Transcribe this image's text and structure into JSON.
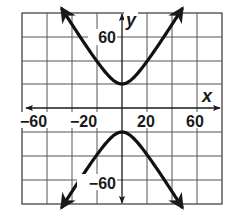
{
  "chart_data": {
    "type": "line",
    "title": "",
    "xlabel": "x",
    "ylabel": "y",
    "xlim": [
      -80,
      80
    ],
    "ylim": [
      -80,
      80
    ],
    "grid": true,
    "grid_step": 20,
    "x_tick_labels": [
      {
        "value": -60,
        "text": "−60"
      },
      {
        "value": -20,
        "text": "−20"
      },
      {
        "value": 20,
        "text": "20"
      },
      {
        "value": 60,
        "text": "60"
      }
    ],
    "y_tick_labels": [
      {
        "value": 60,
        "text": "60"
      },
      {
        "value": -60,
        "text": "−60"
      }
    ],
    "equation": "y^2/400 - x^2/144 = 1",
    "curve_kind": "hyperbola (vertical transverse axis)",
    "vertices": [
      [
        0,
        20
      ],
      [
        0,
        -20
      ]
    ],
    "series": [
      {
        "name": "upper branch",
        "x": [
          -48,
          -40,
          -30,
          -20,
          -10,
          0,
          10,
          20,
          30,
          40,
          48
        ],
        "y": [
          52,
          69.4,
          53.9,
          38.9,
          26.0,
          20,
          26.0,
          38.9,
          53.9,
          69.4,
          82.5
        ]
      },
      {
        "name": "lower branch",
        "x": [
          -48,
          -40,
          -30,
          -20,
          -10,
          0,
          10,
          20,
          30,
          40,
          48
        ],
        "y": [
          -82.5,
          -69.4,
          -53.9,
          -38.9,
          -26.0,
          -20,
          -26.0,
          -38.9,
          -53.9,
          -69.4,
          -82.5
        ]
      }
    ],
    "legend": []
  },
  "labels": {
    "x_axis": "x",
    "y_axis": "y",
    "x_neg60": "−60",
    "x_neg20": "−20",
    "x_pos20": "20",
    "x_pos60": "60",
    "y_pos60": "60",
    "y_neg60": "−60"
  }
}
